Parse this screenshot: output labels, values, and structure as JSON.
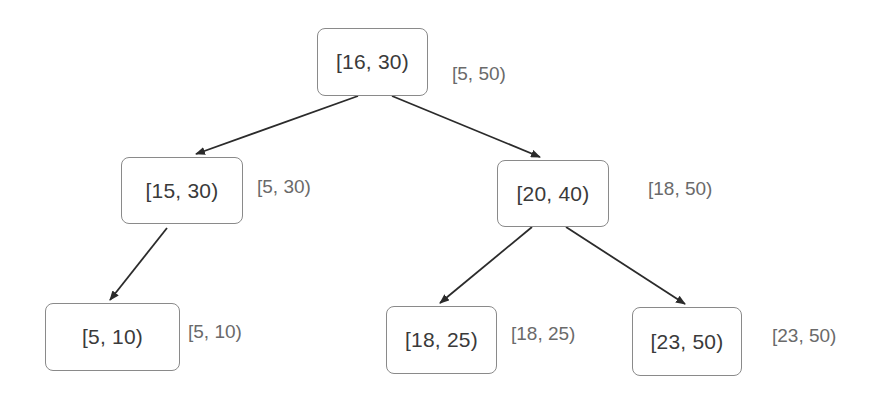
{
  "diagram": {
    "type": "interval-tree",
    "nodes": [
      {
        "id": "root",
        "interval": "[16, 30)",
        "range": "[5, 50)",
        "box": {
          "x": 317,
          "y": 28,
          "w": 111,
          "h": 68
        },
        "label_pos": {
          "x": 452,
          "y": 63
        }
      },
      {
        "id": "l",
        "interval": "[15, 30)",
        "range": "[5, 30)",
        "box": {
          "x": 121,
          "y": 157,
          "w": 122,
          "h": 67
        },
        "label_pos": {
          "x": 257,
          "y": 176
        }
      },
      {
        "id": "r",
        "interval": "[20, 40)",
        "range": "[18, 50)",
        "box": {
          "x": 497,
          "y": 160,
          "w": 112,
          "h": 67
        },
        "label_pos": {
          "x": 648,
          "y": 178
        }
      },
      {
        "id": "ll",
        "interval": "[5, 10)",
        "range": "[5, 10)",
        "box": {
          "x": 45,
          "y": 303,
          "w": 135,
          "h": 68
        },
        "label_pos": {
          "x": 188,
          "y": 321
        }
      },
      {
        "id": "rl",
        "interval": "[18, 25)",
        "range": "[18, 25)",
        "box": {
          "x": 386,
          "y": 306,
          "w": 111,
          "h": 68
        },
        "label_pos": {
          "x": 511,
          "y": 323
        }
      },
      {
        "id": "rr",
        "interval": "[23, 50)",
        "range": "[23, 50)",
        "box": {
          "x": 632,
          "y": 307,
          "w": 110,
          "h": 69
        },
        "label_pos": {
          "x": 772,
          "y": 325
        }
      }
    ],
    "edges": [
      {
        "from": "root",
        "to": "l",
        "x1": 358,
        "y1": 96,
        "x2": 196,
        "y2": 154
      },
      {
        "from": "root",
        "to": "r",
        "x1": 392,
        "y1": 96,
        "x2": 540,
        "y2": 157
      },
      {
        "from": "l",
        "to": "ll",
        "x1": 167,
        "y1": 228,
        "x2": 110,
        "y2": 300
      },
      {
        "from": "r",
        "to": "rl",
        "x1": 532,
        "y1": 227,
        "x2": 440,
        "y2": 303
      },
      {
        "from": "r",
        "to": "rr",
        "x1": 566,
        "y1": 227,
        "x2": 685,
        "y2": 304
      }
    ],
    "colors": {
      "node_border": "#8a8a8a",
      "node_text": "#3a3a3a",
      "range_text": "#6a6a6a",
      "edge": "#2b2b2b"
    }
  }
}
